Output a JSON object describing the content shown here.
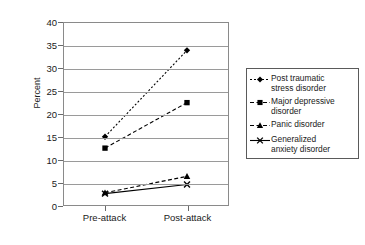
{
  "chart_data": {
    "type": "line",
    "title": "",
    "xlabel": "",
    "ylabel": "Percent",
    "categories": [
      "Pre-attack",
      "Post-attack"
    ],
    "ylim": [
      0,
      40
    ],
    "yticks": [
      0,
      5,
      10,
      15,
      20,
      25,
      30,
      35,
      40
    ],
    "ytick_labels": [
      "0",
      "5",
      "10",
      "15",
      "20",
      "25",
      "30",
      "35",
      "40"
    ],
    "grid": true,
    "legend_position": "right",
    "series": [
      {
        "name": "Post traumatic stress disorder",
        "values": [
          15,
          34
        ],
        "marker": "diamond",
        "line_style": "dotted",
        "color": "#000000"
      },
      {
        "name": "Major depressive disorder",
        "values": [
          12.5,
          22.5
        ],
        "marker": "square",
        "line_style": "dashed",
        "color": "#000000"
      },
      {
        "name": "Panic disorder",
        "values": [
          2.7,
          6.3
        ],
        "marker": "triangle",
        "line_style": "dashed",
        "color": "#000000"
      },
      {
        "name": "Generalized anxiety disorder",
        "values": [
          2.5,
          4.5
        ],
        "marker": "cross",
        "line_style": "solid",
        "color": "#000000"
      }
    ]
  },
  "legend": {
    "items": [
      {
        "label_line1": "Post traumatic",
        "label_line2": "stress disorder"
      },
      {
        "label_line1": "Major depressive",
        "label_line2": "disorder"
      },
      {
        "label_line1": "Panic disorder",
        "label_line2": ""
      },
      {
        "label_line1": "Generalized",
        "label_line2": "anxiety disorder"
      }
    ]
  }
}
